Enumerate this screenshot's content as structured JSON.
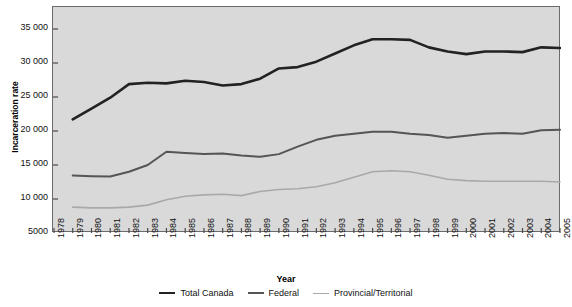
{
  "chart_data": {
    "type": "line",
    "title": "",
    "xlabel": "Year",
    "ylabel": "Incarceration rate",
    "xlim": [
      1978,
      2005
    ],
    "ylim": [
      5000,
      35000
    ],
    "ytick_values": [
      5000,
      10000,
      15000,
      20000,
      25000,
      30000,
      35000
    ],
    "ytick_labels": [
      "5000",
      "10 000",
      "15 000",
      "20 000",
      "25 000",
      "30 000",
      "35 000"
    ],
    "x": [
      1978,
      1979,
      1980,
      1981,
      1982,
      1983,
      1984,
      1985,
      1986,
      1987,
      1988,
      1989,
      1990,
      1991,
      1992,
      1993,
      1994,
      1995,
      1996,
      1997,
      1998,
      1999,
      2000,
      2001,
      2002,
      2003,
      2004,
      2005
    ],
    "xtick_labels": [
      "1978",
      "1979",
      "1980",
      "1981",
      "1982",
      "1983",
      "1984",
      "1985",
      "1986",
      "1987",
      "1988",
      "1989",
      "1990",
      "1991",
      "1992",
      "1993",
      "1994",
      "1995",
      "1996",
      "1997",
      "1998",
      "1999",
      "2000",
      "2001",
      "2002",
      "2003",
      "2004",
      "2005"
    ],
    "grid": false,
    "legend_position": "bottom",
    "series": [
      {
        "name": "Total Canada",
        "color": "#222222",
        "width": 2.6,
        "values": [
          null,
          21700,
          23300,
          24900,
          26900,
          27100,
          27000,
          27400,
          27200,
          26700,
          26900,
          27700,
          29200,
          29400,
          30200,
          31400,
          32600,
          33500,
          33500,
          33400,
          32300,
          31700,
          31300,
          31700,
          31700,
          31600,
          32300,
          32200
        ]
      },
      {
        "name": "Federal",
        "color": "#555555",
        "width": 2.0,
        "values": [
          null,
          13450,
          13350,
          13300,
          14000,
          15000,
          16950,
          16750,
          16600,
          16700,
          16400,
          16200,
          16600,
          17700,
          18700,
          19300,
          19600,
          19900,
          19900,
          19600,
          19400,
          19000,
          19300,
          19600,
          19700,
          19600,
          20100,
          20200
        ]
      },
      {
        "name": "Provincial/Territorial",
        "color": "#a9a9a9",
        "width": 1.6,
        "values": [
          null,
          8800,
          8700,
          8700,
          8800,
          9100,
          9900,
          10400,
          10600,
          10700,
          10500,
          11100,
          11400,
          11500,
          11800,
          12400,
          13200,
          14000,
          14150,
          14000,
          13500,
          12900,
          12700,
          12600,
          12600,
          12600,
          12600,
          12500
        ]
      }
    ]
  },
  "legend": {
    "items": [
      {
        "label": "Total Canada"
      },
      {
        "label": "Federal"
      },
      {
        "label": "Provincial/Territorial"
      }
    ]
  }
}
